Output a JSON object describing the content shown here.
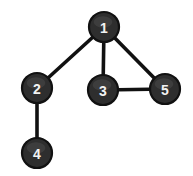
{
  "figure": {
    "background_color": "#ffffff",
    "width": 193,
    "height": 176
  },
  "graph_data": {
    "type": "node-link-diagram",
    "directed": false,
    "node_radius": 15,
    "node_fill": "#2e2e2e",
    "node_stroke": "#111111",
    "label_color": "#f2f2f2",
    "edge_color": "#111111",
    "edge_width": 3.6,
    "nodes": [
      {
        "id": "1",
        "label": "1",
        "x": 104,
        "y": 27
      },
      {
        "id": "2",
        "label": "2",
        "x": 37,
        "y": 88
      },
      {
        "id": "3",
        "label": "3",
        "x": 103,
        "y": 90
      },
      {
        "id": "4",
        "label": "4",
        "x": 37,
        "y": 153
      },
      {
        "id": "5",
        "label": "5",
        "x": 165,
        "y": 89
      }
    ],
    "edges": [
      {
        "id": "1-2",
        "source": "1",
        "target": "2",
        "x1": 104,
        "y1": 27,
        "x2": 37,
        "y2": 88
      },
      {
        "id": "1-3",
        "source": "1",
        "target": "3",
        "x1": 104,
        "y1": 27,
        "x2": 103,
        "y2": 90
      },
      {
        "id": "1-5",
        "source": "1",
        "target": "5",
        "x1": 104,
        "y1": 27,
        "x2": 165,
        "y2": 89
      },
      {
        "id": "3-5",
        "source": "3",
        "target": "5",
        "x1": 103,
        "y1": 90,
        "x2": 165,
        "y2": 89
      },
      {
        "id": "2-4",
        "source": "2",
        "target": "4",
        "x1": 37,
        "y1": 88,
        "x2": 37,
        "y2": 153
      }
    ]
  }
}
